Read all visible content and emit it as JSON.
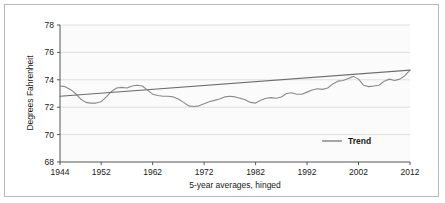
{
  "chart_data": {
    "type": "line",
    "title": "",
    "subtitle": "",
    "xlabel": "5-year averages, hinged",
    "ylabel": "Degrees Fahrenheit",
    "xlim": [
      1944,
      2012
    ],
    "ylim": [
      68,
      78
    ],
    "xticks": [
      1944,
      1952,
      1962,
      1972,
      1982,
      1992,
      2002,
      2012
    ],
    "xtick_labels": [
      "1944",
      "1952",
      "1962",
      "1972",
      "1982",
      "1992",
      "2002",
      "2012"
    ],
    "yticks": [
      68,
      70,
      72,
      74,
      76,
      78
    ],
    "ytick_labels": [
      "68",
      "70",
      "72",
      "74",
      "76",
      "78"
    ],
    "grid": "horizontal",
    "legend_position": "lower-right",
    "legend_entries": [
      "Trend"
    ],
    "series": [
      {
        "name": "5-year average temperature",
        "color": "#8a8a8a",
        "in_legend": false,
        "x": [
          1944,
          1945,
          1946,
          1947,
          1948,
          1949,
          1950,
          1951,
          1952,
          1953,
          1954,
          1955,
          1956,
          1957,
          1958,
          1959,
          1960,
          1961,
          1962,
          1963,
          1964,
          1965,
          1966,
          1967,
          1968,
          1969,
          1970,
          1971,
          1972,
          1973,
          1974,
          1975,
          1976,
          1977,
          1978,
          1979,
          1980,
          1981,
          1982,
          1983,
          1984,
          1985,
          1986,
          1987,
          1988,
          1989,
          1990,
          1991,
          1992,
          1993,
          1994,
          1995,
          1996,
          1997,
          1998,
          1999,
          2000,
          2001,
          2002,
          2003,
          2004,
          2005,
          2006,
          2007,
          2008,
          2009,
          2010,
          2011,
          2012
        ],
        "y": [
          73.55,
          73.5,
          73.3,
          73.0,
          72.6,
          72.35,
          72.3,
          72.3,
          72.4,
          72.75,
          73.15,
          73.4,
          73.45,
          73.4,
          73.55,
          73.6,
          73.55,
          73.25,
          72.95,
          72.85,
          72.8,
          72.8,
          72.75,
          72.6,
          72.35,
          72.1,
          72.05,
          72.1,
          72.25,
          72.4,
          72.5,
          72.6,
          72.75,
          72.8,
          72.75,
          72.65,
          72.55,
          72.35,
          72.3,
          72.5,
          72.65,
          72.7,
          72.65,
          72.75,
          73.0,
          73.05,
          72.95,
          72.95,
          73.1,
          73.25,
          73.35,
          73.3,
          73.4,
          73.7,
          73.9,
          73.95,
          74.1,
          74.25,
          74.05,
          73.6,
          73.5,
          73.55,
          73.6,
          73.55,
          73.5,
          73.5,
          73.45,
          73.4,
          73.45
        ]
      },
      {
        "name": "Trend",
        "color": "#6e6e6e",
        "in_legend": true,
        "x": [
          1944,
          2012
        ],
        "y": [
          72.8,
          74.7
        ]
      }
    ],
    "extra_series_tail": {
      "note": "continued wiggle 1996-2012 appended to primary series",
      "x": [
        1996,
        1997,
        1998,
        1999,
        2000,
        2001,
        2002,
        2003,
        2004,
        2005,
        2006,
        2007,
        2008,
        2009,
        2010,
        2011,
        2012
      ],
      "y": [
        73.4,
        73.7,
        73.9,
        73.95,
        74.1,
        74.25,
        74.05,
        73.6,
        73.5,
        73.55,
        73.6,
        73.9,
        74.05,
        73.95,
        74.05,
        74.3,
        74.7
      ]
    }
  },
  "legend": {
    "trend_label": "Trend"
  },
  "axes": {
    "y_title": "Degrees Fahrenheit",
    "x_title": "5-year averages, hinged"
  }
}
